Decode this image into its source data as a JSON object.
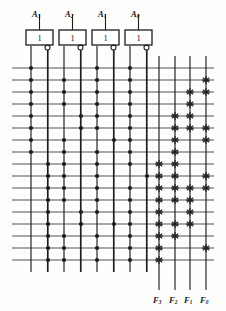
{
  "figure": {
    "kind": "pla-programmable-logic-array",
    "title": "",
    "ink_color": "#1d1d1d",
    "line_color": "#555555",
    "paper_color": "#fdfdfc"
  },
  "inputs": {
    "count": 4,
    "labels": [
      "A",
      "A",
      "A",
      "A"
    ],
    "subscripts": [
      "3",
      "2",
      "1",
      "0"
    ],
    "label_x": [
      39,
      72,
      105,
      138
    ],
    "label_y": 10
  },
  "gates": {
    "count": 4,
    "symbol": "1",
    "bubble": "inversion-bubble",
    "boxes": [
      {
        "x": 26,
        "y": 30,
        "w": 27,
        "h": 15
      },
      {
        "x": 59,
        "y": 30,
        "w": 27,
        "h": 15
      },
      {
        "x": 92,
        "y": 30,
        "w": 27,
        "h": 15
      },
      {
        "x": 125,
        "y": 30,
        "w": 27,
        "h": 15
      }
    ]
  },
  "grid": {
    "row_count": 17,
    "row_y": [
      68,
      80,
      92,
      104,
      116,
      128,
      140,
      152,
      164,
      176,
      188,
      200,
      212,
      224,
      236,
      248,
      260
    ],
    "row_x_start": 12,
    "row_x_end": 214,
    "and_columns_x": [
      31,
      48,
      64,
      81,
      97,
      114,
      130,
      147
    ],
    "and_column_top": 46,
    "and_column_bottom": 272,
    "or_columns_x": [
      159,
      175,
      190,
      206
    ],
    "or_column_top": 56,
    "or_column_bottom": 286
  },
  "and_plane": {
    "legend": "dot = input line connected to product term row",
    "dot_radius": 2.1,
    "dots": [
      [
        31,
        97,
        130
      ],
      [
        31,
        64,
        97,
        130
      ],
      [
        31,
        64,
        97,
        130
      ],
      [
        31,
        64,
        97,
        130
      ],
      [
        31,
        81,
        97,
        130
      ],
      [
        31,
        81,
        97,
        130
      ],
      [
        31,
        64,
        114,
        130
      ],
      [
        31,
        64,
        97,
        130
      ],
      [
        48,
        64,
        97,
        130
      ],
      [
        48,
        64,
        97,
        147
      ],
      [
        48,
        64,
        97,
        130
      ],
      [
        48,
        64,
        97,
        130
      ],
      [
        48,
        81,
        97,
        130
      ],
      [
        48,
        81,
        114,
        130
      ],
      [
        48,
        64,
        97,
        130
      ],
      [
        48,
        64,
        97,
        130
      ],
      [
        48,
        64,
        97,
        130
      ]
    ]
  },
  "or_plane": {
    "legend": "x = product term contributes to output column",
    "cross_radius": 3.4,
    "crosses": [
      [],
      [
        206
      ],
      [
        190,
        206
      ],
      [
        190
      ],
      [
        175,
        190
      ],
      [
        175,
        190,
        206
      ],
      [
        175,
        206
      ],
      [
        175
      ],
      [
        159,
        175
      ],
      [
        159,
        175,
        206
      ],
      [
        159,
        175,
        190,
        206
      ],
      [
        159,
        175,
        190
      ],
      [
        159,
        190
      ],
      [
        159,
        175,
        190
      ],
      [
        159,
        175
      ],
      [
        159,
        206
      ],
      [
        159
      ]
    ]
  },
  "outputs": {
    "count": 4,
    "labels": [
      "F",
      "F",
      "F",
      "F"
    ],
    "subscripts": [
      "3",
      "2",
      "1",
      "0"
    ],
    "label_x": [
      159,
      175,
      190,
      206
    ],
    "label_y": 296
  }
}
